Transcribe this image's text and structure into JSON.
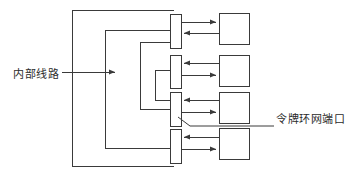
{
  "diagram": {
    "type": "block-diagram",
    "title": "",
    "stroke_color": "#3a3a3a",
    "background_color": "#ffffff",
    "labels": {
      "internal_circuit": "内部线路",
      "token_ring_port": "令牌环网端口"
    },
    "annotations": [
      {
        "name": "internal-circuit-label",
        "text": "内部线路",
        "position": "left",
        "leader": "horizontal-arrow-right",
        "points_to": "internal-bus"
      },
      {
        "name": "token-ring-port-label",
        "text": "令牌环网端口",
        "position": "right",
        "leader": "diagonal-then-horizontal",
        "points_to": "port-3"
      }
    ],
    "ports": [
      {
        "id": "port-1",
        "name": "token-ring-port-1",
        "x": 170,
        "y": 14,
        "w": 11,
        "h": 34
      },
      {
        "id": "port-2",
        "name": "token-ring-port-2",
        "x": 170,
        "y": 55,
        "w": 11,
        "h": 33
      },
      {
        "id": "port-3",
        "name": "token-ring-port-3",
        "x": 170,
        "y": 92,
        "w": 11,
        "h": 34
      },
      {
        "id": "port-4",
        "name": "token-ring-port-4",
        "x": 170,
        "y": 129,
        "w": 11,
        "h": 34
      }
    ],
    "devices": [
      {
        "id": "device-1",
        "name": "network-node-1",
        "x": 219,
        "y": 13,
        "w": 30,
        "h": 31
      },
      {
        "id": "device-2",
        "name": "network-node-2",
        "x": 219,
        "y": 55,
        "w": 30,
        "h": 31
      },
      {
        "id": "device-3",
        "name": "network-node-3",
        "x": 219,
        "y": 92,
        "w": 30,
        "h": 31
      },
      {
        "id": "device-4",
        "name": "network-node-4",
        "x": 219,
        "y": 128,
        "w": 30,
        "h": 31
      }
    ],
    "link_directions": [
      {
        "row": 1,
        "upper": "to-device",
        "lower": "to-port"
      },
      {
        "row": 2,
        "upper": "to-port",
        "lower": "to-device"
      },
      {
        "row": 3,
        "upper": "to-port",
        "lower": "to-device"
      },
      {
        "row": 4,
        "upper": "to-port",
        "lower": "to-device"
      }
    ],
    "bus": {
      "name": "internal-bus",
      "entry_arrow_y": 72,
      "entry_arrow_x_start": 62,
      "entry_arrow_x_end": 118
    }
  }
}
